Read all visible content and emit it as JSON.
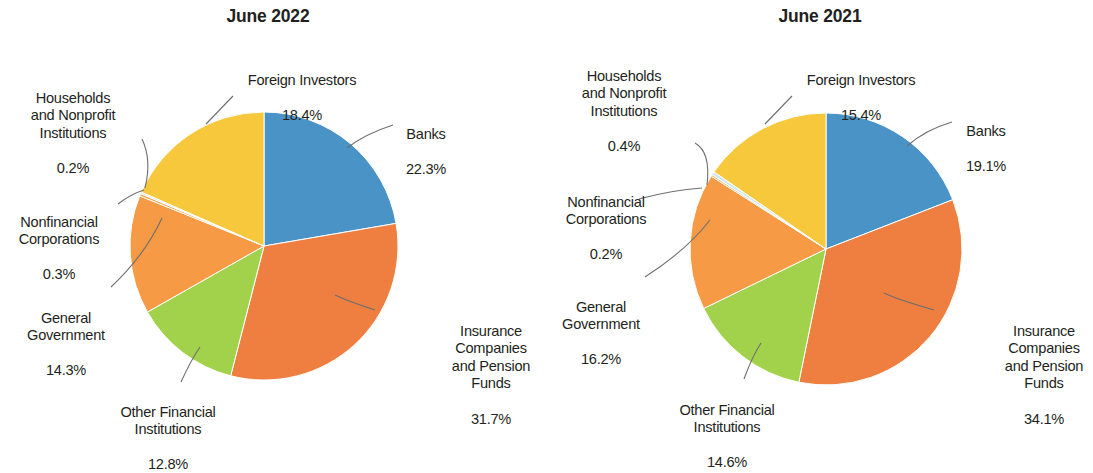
{
  "palette": {
    "banks": "#4a93c6",
    "insurance": "#ef7f41",
    "other_financial": "#a2d24b",
    "general_government": "#f79a45",
    "nonfinancial": "#f7a84b",
    "households": "#cfe8ee",
    "foreign_investors": "#f7c73c",
    "leader_line": "#6d6e70",
    "text": "#231f20"
  },
  "chart_data": [
    {
      "type": "pie",
      "title": "June 2022",
      "xlabel": "",
      "ylabel": "",
      "legend_position": "none",
      "grid": false,
      "start_angle_deg": 0,
      "direction": "clockwise",
      "unit": "%",
      "categories": [
        "Banks",
        "Insurance Companies and Pension Funds",
        "Other Financial Institutions",
        "General Government",
        "Nonfinancial Corporations",
        "Households and Nonprofit Institutions",
        "Foreign Investors"
      ],
      "values": [
        22.3,
        31.7,
        12.8,
        14.3,
        0.3,
        0.2,
        18.4
      ],
      "labels": [
        {
          "name": "Banks",
          "text": "Banks",
          "value": "22.3%"
        },
        {
          "name": "Insurance Companies and Pension Funds",
          "text": "Insurance\nCompanies\nand Pension\nFunds",
          "value": "31.7%"
        },
        {
          "name": "Other Financial Institutions",
          "text": "Other Financial\nInstitutions",
          "value": "12.8%"
        },
        {
          "name": "General Government",
          "text": "General\nGovernment",
          "value": "14.3%"
        },
        {
          "name": "Nonfinancial Corporations",
          "text": "Nonfinancial\nCorporations",
          "value": "0.3%"
        },
        {
          "name": "Households and Nonprofit Institutions",
          "text": "Households\nand Nonprofit\nInstitutions",
          "value": "0.2%"
        },
        {
          "name": "Foreign Investors",
          "text": "Foreign Investors",
          "value": "18.4%"
        }
      ]
    },
    {
      "type": "pie",
      "title": "June 2021",
      "xlabel": "",
      "ylabel": "",
      "legend_position": "none",
      "grid": false,
      "start_angle_deg": 0,
      "direction": "clockwise",
      "unit": "%",
      "categories": [
        "Banks",
        "Insurance Companies and Pension Funds",
        "Other Financial Institutions",
        "General Government",
        "Nonfinancial Corporations",
        "Households and Nonprofit Institutions",
        "Foreign Investors"
      ],
      "values": [
        19.1,
        34.1,
        14.6,
        16.2,
        0.2,
        0.4,
        15.4
      ],
      "labels": [
        {
          "name": "Banks",
          "text": "Banks",
          "value": "19.1%"
        },
        {
          "name": "Insurance Companies and Pension Funds",
          "text": "Insurance\nCompanies\nand Pension\nFunds",
          "value": "34.1%"
        },
        {
          "name": "Other Financial Institutions",
          "text": "Other Financial\nInstitutions",
          "value": "14.6%"
        },
        {
          "name": "General Government",
          "text": "General\nGovernment",
          "value": "16.2%"
        },
        {
          "name": "Nonfinancial Corporations",
          "text": "Nonfinancial\nCorporations",
          "value": "0.2%"
        },
        {
          "name": "Households and Nonprofit Institutions",
          "text": "Households\nand Nonprofit\nInstitutions",
          "value": "0.4%"
        },
        {
          "name": "Foreign Investors",
          "text": "Foreign Investors",
          "value": "15.4%"
        }
      ]
    }
  ],
  "left": {
    "title": "June 2022",
    "labels": {
      "banks": {
        "text": "Banks",
        "value": "22.3%"
      },
      "insurance": {
        "text": "Insurance\nCompanies\nand Pension\nFunds",
        "value": "31.7%"
      },
      "other": {
        "text": "Other Financial\nInstitutions",
        "value": "12.8%"
      },
      "government": {
        "text": "General\nGovernment",
        "value": "14.3%"
      },
      "nonfinancial": {
        "text": "Nonfinancial\nCorporations",
        "value": "0.3%"
      },
      "households": {
        "text": "Households\nand Nonprofit\nInstitutions",
        "value": "0.2%"
      },
      "foreign": {
        "text": "Foreign Investors",
        "value": "18.4%"
      }
    }
  },
  "right": {
    "title": "June 2021",
    "labels": {
      "banks": {
        "text": "Banks",
        "value": "19.1%"
      },
      "insurance": {
        "text": "Insurance\nCompanies\nand Pension\nFunds",
        "value": "34.1%"
      },
      "other": {
        "text": "Other Financial\nInstitutions",
        "value": "14.6%"
      },
      "government": {
        "text": "General\nGovernment",
        "value": "16.2%"
      },
      "nonfinancial": {
        "text": "Nonfinancial\nCorporations",
        "value": "0.2%"
      },
      "households": {
        "text": "Households\nand Nonprofit\nInstitutions",
        "value": "0.4%"
      },
      "foreign": {
        "text": "Foreign Investors",
        "value": "15.4%"
      }
    }
  }
}
